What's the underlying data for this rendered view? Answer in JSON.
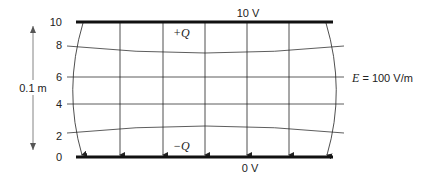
{
  "diagram": {
    "top_plate": {
      "label": "10 V",
      "charge": "+Q"
    },
    "bottom_plate": {
      "label": "0 V",
      "charge": "−Q"
    },
    "potential_ticks": [
      "10",
      "8",
      "6",
      "4",
      "2",
      "0"
    ],
    "field_label_E": "E",
    "field_label_value": " = 100 V/m",
    "separation_label": "0.1 m"
  }
}
